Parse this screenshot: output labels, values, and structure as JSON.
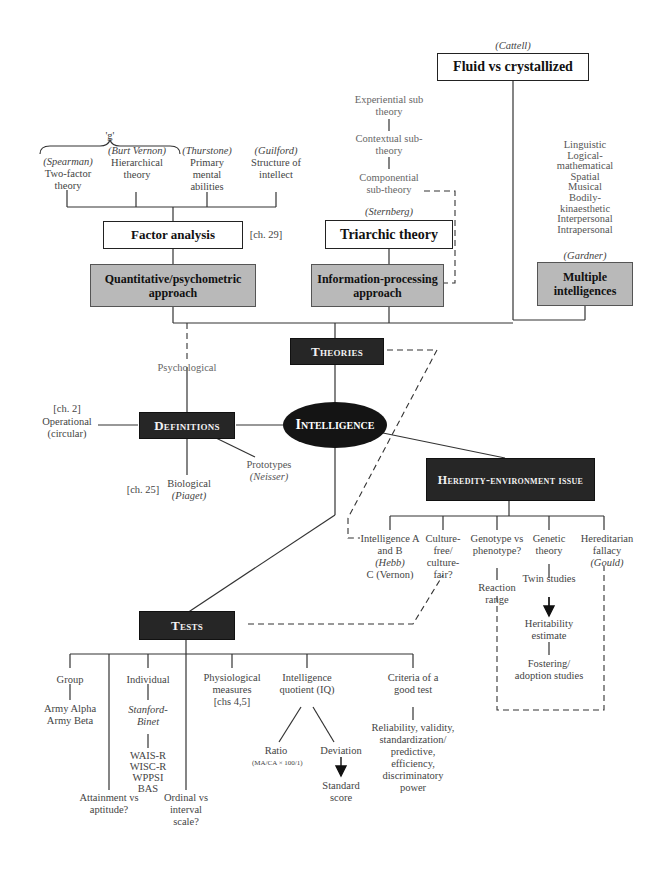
{
  "center": {
    "label": "Intelligence"
  },
  "theories": {
    "label": "Theories",
    "fluid": {
      "author": "(Cattell)",
      "label": "Fluid vs crystallized"
    },
    "g_label": "'g'",
    "factor_theories": [
      {
        "author": "(Spearman)",
        "label": "Two-factor theory"
      },
      {
        "author": "(Burt Vernon)",
        "label": "Hierarchical theory"
      },
      {
        "author": "(Thurstone)",
        "label": "Primary mental abilities"
      },
      {
        "author": "(Guilford)",
        "label": "Structure of intellect"
      }
    ],
    "factor_analysis": {
      "label": "Factor analysis",
      "ref": "[ch. 29]"
    },
    "quantitative": {
      "label": "Quantitative/psychometric approach"
    },
    "sternberg": {
      "subtheories": [
        "Experiential sub theory",
        "Contextual sub-theory",
        "Componential sub-theory"
      ],
      "author": "(Sternberg)",
      "label": "Triarchic theory"
    },
    "information_processing": {
      "label": "Information-processing approach"
    },
    "gardner": {
      "intelligences": [
        "Linguistic",
        "Logical-",
        "mathematical",
        "Spatial",
        "Musical",
        "Bodily-",
        "kinaesthetic",
        "Interpersonal",
        "Intrapersonal"
      ],
      "author": "(Gardner)",
      "label": "Multiple intelligences"
    }
  },
  "definitions": {
    "label": "Definitions",
    "psychological": "Psychological",
    "operational": {
      "ref": "[ch. 2]",
      "label": "Operational (circular)"
    },
    "biological": {
      "ref": "[ch. 25]",
      "label": "Biological",
      "author": "(Piaget)"
    },
    "prototypes": {
      "label": "Prototypes",
      "author": "(Neisser)"
    }
  },
  "heredity": {
    "label": "Heredity-environment issue",
    "items": [
      {
        "label": "Intelligence A and B",
        "author1": "(Hebb)",
        "author2": "C (Vernon)"
      },
      {
        "label": "Culture-free/ culture-fair?"
      },
      {
        "label": "Genotype vs phenotype?",
        "child": "Reaction range"
      },
      {
        "label": "Genetic theory",
        "chain": [
          "Twin studies",
          "Heritability estimate",
          "Fostering/ adoption studies"
        ]
      },
      {
        "label": "Hereditarian fallacy",
        "author": "(Gould)"
      }
    ]
  },
  "tests": {
    "label": "Tests",
    "group": {
      "label": "Group",
      "examples": [
        "Army Alpha",
        "Army Beta"
      ]
    },
    "attainment": "Attainment vs aptitude?",
    "individual": {
      "label": "Individual",
      "stanford": "Stanford-Binet",
      "examples": [
        "WAIS-R",
        "WISC-R",
        "WPPSI",
        "BAS"
      ]
    },
    "ordinal": "Ordinal vs interval scale?",
    "physiological": {
      "label": "Physiological measures",
      "ref": "[chs 4,5]"
    },
    "iq": {
      "label": "Intelligence quotient (IQ)",
      "ratio": "Ratio",
      "formula": "(MA/CA × 100/1)",
      "deviation": "Deviation",
      "standard": "Standard score"
    },
    "criteria": {
      "label": "Criteria of a good test",
      "items": "Reliability, validity, standardization/ predictive, efficiency, discriminatory power"
    }
  }
}
